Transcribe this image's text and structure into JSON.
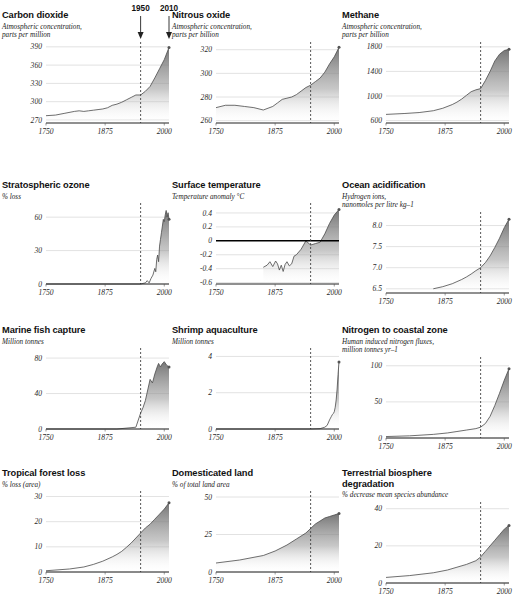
{
  "figure": {
    "annotations": [
      {
        "label": "1950",
        "x_year": 1950
      },
      {
        "label": "2010",
        "x_year": 2010
      }
    ],
    "marker_year": 1950,
    "x_ticks": [
      "1750",
      "1875",
      "2000"
    ],
    "x_range": [
      1750,
      2010
    ],
    "colors": {
      "area_top": "#6e6e6e",
      "area_bottom": "#ffffff",
      "line": "#4a4a4a",
      "grid": "#c9c9c9",
      "axis": "#222222",
      "text": "#111111"
    }
  },
  "chart_data": [
    {
      "id": "carbon-dioxide",
      "type": "area",
      "title": "Carbon dioxide",
      "subtitle": "Atmospheric concentration,\nparts per million",
      "ylabel": "",
      "xlabel": "",
      "y_ticks": [
        "270",
        "300",
        "330",
        "360",
        "390"
      ],
      "y_tick_values": [
        270,
        300,
        330,
        360,
        390
      ],
      "ylim": [
        265,
        393
      ],
      "xlim": [
        1750,
        2010
      ],
      "grid": true,
      "x": [
        1750,
        1770,
        1790,
        1810,
        1820,
        1830,
        1840,
        1850,
        1860,
        1870,
        1880,
        1890,
        1900,
        1910,
        1920,
        1930,
        1940,
        1950,
        1960,
        1970,
        1980,
        1990,
        2000,
        2010
      ],
      "values": [
        277,
        278,
        281,
        284,
        285,
        284,
        285,
        286,
        287,
        288,
        290,
        294,
        296,
        299,
        303,
        307,
        311,
        311,
        317,
        325,
        339,
        354,
        369,
        389
      ]
    },
    {
      "id": "nitrous-oxide",
      "type": "area",
      "title": "Nitrous oxide",
      "subtitle": "Atmospheric concentration,\nparts per billion",
      "y_ticks": [
        "260",
        "280",
        "300",
        "320"
      ],
      "y_tick_values": [
        260,
        280,
        300,
        320
      ],
      "ylim": [
        258,
        324
      ],
      "xlim": [
        1750,
        2010
      ],
      "grid": true,
      "x": [
        1750,
        1770,
        1790,
        1810,
        1830,
        1850,
        1870,
        1880,
        1890,
        1900,
        1910,
        1920,
        1930,
        1940,
        1950,
        1960,
        1970,
        1980,
        1990,
        2000,
        2010
      ],
      "values": [
        271,
        273,
        273,
        272,
        271,
        269,
        272,
        275,
        278,
        279,
        280,
        282,
        285,
        288,
        290,
        293,
        296,
        301,
        308,
        314,
        322
      ]
    },
    {
      "id": "methane",
      "type": "area",
      "title": "Methane",
      "subtitle": "Atmospheric concentration,\nparts per billion",
      "y_ticks": [
        "600",
        "1000",
        "1400",
        "1800"
      ],
      "y_tick_values": [
        600,
        1000,
        1400,
        1800
      ],
      "ylim": [
        560,
        1830
      ],
      "xlim": [
        1750,
        2010
      ],
      "grid": true,
      "x": [
        1750,
        1790,
        1820,
        1850,
        1870,
        1890,
        1900,
        1910,
        1920,
        1930,
        1940,
        1950,
        1960,
        1970,
        1980,
        1990,
        2000,
        2010
      ],
      "values": [
        700,
        715,
        730,
        760,
        800,
        860,
        900,
        950,
        1010,
        1070,
        1100,
        1120,
        1250,
        1400,
        1570,
        1680,
        1740,
        1760
      ]
    },
    {
      "id": "stratospheric-ozone",
      "type": "area",
      "title": "Stratospheric ozone",
      "subtitle": "% loss",
      "y_ticks": [
        "0",
        "30",
        "60"
      ],
      "y_tick_values": [
        0,
        30,
        60
      ],
      "ylim": [
        0,
        70
      ],
      "xlim": [
        1750,
        2010
      ],
      "grid": true,
      "x": [
        1750,
        1900,
        1950,
        1960,
        1964,
        1968,
        1972,
        1976,
        1980,
        1982,
        1984,
        1986,
        1988,
        1990,
        1992,
        1994,
        1996,
        1998,
        2000,
        2002,
        2004,
        2006,
        2008,
        2010
      ],
      "values": [
        0,
        0,
        0,
        1,
        3,
        1,
        5,
        8,
        14,
        11,
        22,
        26,
        20,
        34,
        40,
        46,
        52,
        58,
        56,
        62,
        66,
        60,
        64,
        58
      ]
    },
    {
      "id": "surface-temperature",
      "type": "area",
      "title": "Surface temperature",
      "subtitle": "Temperature anomaly °C",
      "y_ticks": [
        "-0.6",
        "-0.4",
        "-0.2",
        "0",
        "0.2",
        "0.4"
      ],
      "y_tick_values": [
        -0.6,
        -0.4,
        -0.2,
        0,
        0.2,
        0.4
      ],
      "ylim": [
        -0.62,
        0.5
      ],
      "xlim": [
        1750,
        2010
      ],
      "grid": true,
      "zero_line": 0,
      "x": [
        1850,
        1858,
        1864,
        1870,
        1876,
        1880,
        1884,
        1888,
        1892,
        1896,
        1900,
        1905,
        1910,
        1915,
        1920,
        1930,
        1940,
        1950,
        1960,
        1970,
        1980,
        1990,
        2000,
        2010
      ],
      "values": [
        -0.38,
        -0.35,
        -0.3,
        -0.37,
        -0.29,
        -0.33,
        -0.42,
        -0.35,
        -0.44,
        -0.34,
        -0.3,
        -0.36,
        -0.33,
        -0.22,
        -0.2,
        -0.12,
        0.0,
        -0.06,
        -0.04,
        -0.02,
        0.1,
        0.25,
        0.37,
        0.45
      ]
    },
    {
      "id": "ocean-acidification",
      "type": "area",
      "title": "Ocean acidification",
      "subtitle": "Hydrogen ions,\nnanomoles per litre kg–1",
      "y_ticks": [
        "6.5",
        "7.0",
        "7.5",
        "8.0"
      ],
      "y_tick_values": [
        6.5,
        7.0,
        7.5,
        8.0
      ],
      "ylim": [
        6.4,
        8.25
      ],
      "xlim": [
        1750,
        2010
      ],
      "grid": true,
      "x": [
        1850,
        1870,
        1890,
        1900,
        1910,
        1920,
        1930,
        1940,
        1950,
        1960,
        1970,
        1980,
        1990,
        2000,
        2010
      ],
      "values": [
        6.5,
        6.55,
        6.62,
        6.67,
        6.72,
        6.78,
        6.85,
        6.93,
        7.0,
        7.12,
        7.28,
        7.48,
        7.7,
        7.95,
        8.15
      ]
    },
    {
      "id": "marine-fish-capture",
      "type": "area",
      "title": "Marine fish capture",
      "subtitle": "Million tonnes",
      "y_ticks": [
        "0",
        "40",
        "80"
      ],
      "y_tick_values": [
        0,
        40,
        80
      ],
      "ylim": [
        0,
        88
      ],
      "xlim": [
        1750,
        2010
      ],
      "grid": true,
      "x": [
        1750,
        1900,
        1940,
        1950,
        1955,
        1960,
        1965,
        1970,
        1975,
        1980,
        1985,
        1988,
        1990,
        1992,
        1995,
        2000,
        2005,
        2010
      ],
      "values": [
        0,
        0,
        2,
        18,
        24,
        32,
        44,
        56,
        52,
        62,
        70,
        74,
        72,
        70,
        73,
        76,
        72,
        70
      ]
    },
    {
      "id": "shrimp-aquaculture",
      "type": "area",
      "title": "Shrimp aquaculture",
      "subtitle": "Million tonnes",
      "y_ticks": [
        "0",
        "2",
        "4"
      ],
      "y_tick_values": [
        0,
        2,
        4
      ],
      "ylim": [
        0,
        4.3
      ],
      "xlim": [
        1750,
        2010
      ],
      "grid": true,
      "x": [
        1750,
        1950,
        1970,
        1980,
        1985,
        1990,
        1992,
        1994,
        1996,
        1998,
        2000,
        2002,
        2004,
        2006,
        2008,
        2010
      ],
      "values": [
        0,
        0,
        0.02,
        0.1,
        0.2,
        0.5,
        0.6,
        0.7,
        0.8,
        0.85,
        0.95,
        1.2,
        1.6,
        2.2,
        3.0,
        3.7
      ]
    },
    {
      "id": "nitrogen-to-coastal-zone",
      "type": "area",
      "title": "Nitrogen to coastal zone",
      "subtitle": "Human induced nitrogen fluxes,\nmillion tonnes yr–1",
      "y_ticks": [
        "0",
        "50",
        "100"
      ],
      "y_tick_values": [
        0,
        50,
        100
      ],
      "ylim": [
        0,
        108
      ],
      "xlim": [
        1750,
        2010
      ],
      "grid": true,
      "x": [
        1750,
        1800,
        1850,
        1880,
        1900,
        1920,
        1940,
        1950,
        1960,
        1970,
        1980,
        1990,
        2000,
        2010
      ],
      "values": [
        2,
        3,
        5,
        7,
        9,
        11,
        13,
        15,
        20,
        30,
        45,
        62,
        80,
        96
      ]
    },
    {
      "id": "tropical-forest-loss",
      "type": "area",
      "title": "Tropical forest loss",
      "subtitle": "% loss (area)",
      "y_ticks": [
        "0",
        "10",
        "20",
        "30"
      ],
      "y_tick_values": [
        0,
        10,
        20,
        30
      ],
      "ylim": [
        0,
        31
      ],
      "xlim": [
        1750,
        2010
      ],
      "grid": true,
      "x": [
        1750,
        1800,
        1830,
        1850,
        1870,
        1890,
        1900,
        1910,
        1920,
        1930,
        1940,
        1950,
        1960,
        1970,
        1980,
        1990,
        2000,
        2010
      ],
      "values": [
        0.5,
        1.2,
        2.0,
        3.0,
        4.3,
        6.0,
        7.0,
        8.2,
        9.8,
        11.5,
        13.5,
        15.5,
        17.5,
        19.0,
        21.0,
        23.0,
        25.0,
        27.5
      ]
    },
    {
      "id": "domesticated-land",
      "type": "area",
      "title": "Domesticated land",
      "subtitle": "% of total land area",
      "y_ticks": [
        "0",
        "25",
        "50"
      ],
      "y_tick_values": [
        0,
        25,
        50
      ],
      "ylim": [
        0,
        52
      ],
      "xlim": [
        1750,
        2010
      ],
      "grid": true,
      "x": [
        1750,
        1800,
        1850,
        1875,
        1900,
        1920,
        1940,
        1950,
        1960,
        1970,
        1980,
        1990,
        2000,
        2010
      ],
      "values": [
        6,
        8,
        11,
        14,
        18,
        22,
        26,
        29,
        32,
        34,
        36,
        37,
        38,
        39
      ]
    },
    {
      "id": "terrestrial-biosphere-degradation",
      "type": "area",
      "title": "Terrestrial biosphere\ndegradation",
      "subtitle": "% decrease mean species abundance",
      "y_ticks": [
        "0",
        "20",
        "40"
      ],
      "y_tick_values": [
        0,
        20,
        40
      ],
      "ylim": [
        0,
        42
      ],
      "xlim": [
        1750,
        2010
      ],
      "grid": true,
      "x": [
        1750,
        1800,
        1850,
        1880,
        1900,
        1920,
        1940,
        1950,
        1960,
        1970,
        1980,
        1990,
        2000,
        2010
      ],
      "values": [
        3,
        4,
        5.5,
        7,
        8.5,
        10,
        12,
        14,
        17,
        20,
        23,
        26,
        29,
        31
      ]
    }
  ]
}
